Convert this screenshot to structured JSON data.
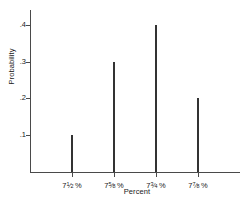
{
  "chart_data": {
    "type": "bar",
    "title": "",
    "subtitle": "",
    "xlabel": "Percent",
    "ylabel": "Probability",
    "categories": [
      "7½ %",
      "7⅝ %",
      "7¾ %",
      "7⅞ %"
    ],
    "values": [
      0.1,
      0.3,
      0.4,
      0.2
    ],
    "ytick_labels": [
      ".1",
      ".2",
      ".3",
      ".4"
    ],
    "ytick_values": [
      0.1,
      0.2,
      0.3,
      0.4
    ],
    "ylim": [
      0,
      0.44
    ],
    "xlim": [
      0,
      5
    ],
    "grid": false,
    "legend": null,
    "annotations": [],
    "style": {
      "bar_color": "#333333",
      "axis_color": "#4a4a4a",
      "text_color": "#1a1a1a",
      "background": "#ffffff",
      "bar_width_px": 2
    }
  },
  "axes": {
    "y_title": "Probability",
    "x_title": "Percent"
  },
  "ticks": {
    "y": [
      {
        "label": ".1",
        "value": 0.1
      },
      {
        "label": ".2",
        "value": 0.2
      },
      {
        "label": ".3",
        "value": 0.3
      },
      {
        "label": ".4",
        "value": 0.4
      }
    ],
    "x": [
      {
        "label": "7½ %",
        "whole": "7",
        "numerator": "1",
        "denominator": "2",
        "suffix": "%"
      },
      {
        "label": "7⅝ %",
        "whole": "7",
        "numerator": "5",
        "denominator": "8",
        "suffix": "%"
      },
      {
        "label": "7¾ %",
        "whole": "7",
        "numerator": "3",
        "denominator": "4",
        "suffix": "%"
      },
      {
        "label": "7⅞ %",
        "whole": "7",
        "numerator": "7",
        "denominator": "8",
        "suffix": "%"
      }
    ]
  },
  "series": [
    {
      "category_index": 0,
      "value": 0.1,
      "value_label": ".1"
    },
    {
      "category_index": 1,
      "value": 0.3,
      "value_label": ".3"
    },
    {
      "category_index": 2,
      "value": 0.4,
      "value_label": ".4"
    },
    {
      "category_index": 3,
      "value": 0.2,
      "value_label": ".2"
    }
  ]
}
